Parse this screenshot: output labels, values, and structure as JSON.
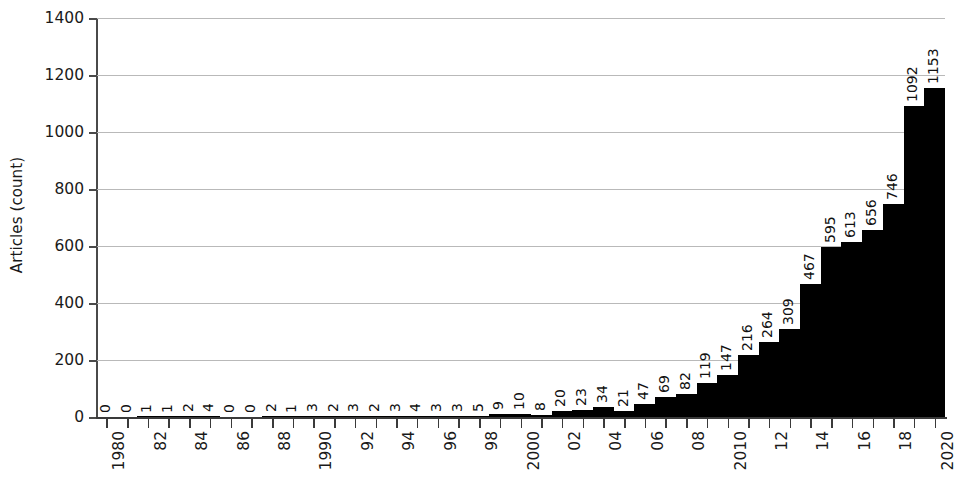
{
  "chart_data": {
    "type": "bar",
    "title": "",
    "xlabel": "",
    "ylabel": "Articles (count)",
    "ylim": [
      0,
      1400
    ],
    "yticks": [
      0,
      200,
      400,
      600,
      800,
      1000,
      1200,
      1400
    ],
    "ytick_labels": [
      "0",
      "200",
      "400",
      "600",
      "800",
      "1000",
      "1200",
      "1400"
    ],
    "grid": true,
    "legend": "none",
    "bar_color": "#000000",
    "grid_color": "#b9b9b9",
    "axis_color": "#3a3a3a",
    "value_labels_shown": true,
    "value_label_rotation": -90,
    "xtick_label_rotation": -90,
    "xtick_label_interval": 2,
    "categories": [
      "1980",
      "1981",
      "1982",
      "1983",
      "1984",
      "1985",
      "1986",
      "1987",
      "1988",
      "1989",
      "1990",
      "1991",
      "1992",
      "1993",
      "1994",
      "1995",
      "1996",
      "1997",
      "1998",
      "1999",
      "2000",
      "2001",
      "2002",
      "2003",
      "2004",
      "2005",
      "2006",
      "2007",
      "2008",
      "2009",
      "2010",
      "2011",
      "2012",
      "2013",
      "2014",
      "2015",
      "2016",
      "2017",
      "2018",
      "2019",
      "2020"
    ],
    "xtick_labels": [
      "1980",
      "",
      "82",
      "",
      "84",
      "",
      "86",
      "",
      "88",
      "",
      "1990",
      "",
      "92",
      "",
      "94",
      "",
      "96",
      "",
      "98",
      "",
      "2000",
      "",
      "02",
      "",
      "04",
      "",
      "06",
      "",
      "08",
      "",
      "2010",
      "",
      "12",
      "",
      "14",
      "",
      "16",
      "",
      "18",
      "",
      "2020"
    ],
    "values": [
      0,
      0,
      1,
      1,
      2,
      4,
      0,
      0,
      2,
      1,
      3,
      2,
      3,
      2,
      3,
      4,
      3,
      3,
      5,
      9,
      10,
      8,
      20,
      23,
      34,
      21,
      47,
      69,
      82,
      119,
      147,
      216,
      264,
      309,
      467,
      595,
      613,
      656,
      746,
      1092,
      1153
    ],
    "value_label_texts": [
      "0",
      "0",
      "1",
      "1",
      "2",
      "4",
      "0",
      "0",
      "2",
      "1",
      "3",
      "2",
      "3",
      "2",
      "3",
      "4",
      "3",
      "3",
      "5",
      "9",
      "10",
      "8",
      "20",
      "23",
      "34",
      "21",
      "47",
      "69",
      "82",
      "119",
      "147",
      "216",
      "264",
      "309",
      "467",
      "595",
      "613",
      "656",
      "746",
      "1092",
      "1153"
    ]
  }
}
